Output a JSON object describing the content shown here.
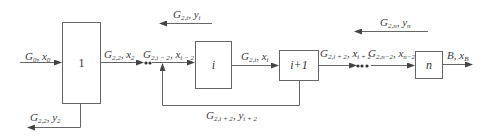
{
  "diagram": {
    "type": "block-flow",
    "line_color": "#555555",
    "blocks": [
      {
        "id": "1",
        "label": "1"
      },
      {
        "id": "i",
        "label": "i"
      },
      {
        "id": "i+1",
        "label": "i+1"
      },
      {
        "id": "n",
        "label": "n"
      }
    ],
    "streams": {
      "feed": {
        "main": "G",
        "sub": "0",
        "sep": ", ",
        "var": "x",
        "vsub": "0"
      },
      "x2": {
        "main": "G",
        "sub": "2,2",
        "sep": ", ",
        "var": "x",
        "vsub": "2"
      },
      "y2": {
        "main": "G",
        "sub": "2,2",
        "sep": ", ",
        "var": "y",
        "vsub": "2"
      },
      "xi_2": {
        "main": "G",
        "sub": "2,i − 2",
        "sep": ", ",
        "var": "x",
        "vsub": "i − 2"
      },
      "yi": {
        "main": "G",
        "sub": "2,i",
        "sep": ", ",
        "var": "y",
        "vsub": "i"
      },
      "xi": {
        "main": "G",
        "sub": "2,i",
        "sep": ", ",
        "var": "x",
        "vsub": "i"
      },
      "yi2": {
        "main": "G",
        "sub": "2,i + 2",
        "sep": ", ",
        "var": "y",
        "vsub": "i + 2"
      },
      "xi2": {
        "main": "G",
        "sub": "2,i + 2",
        "sep": ", ",
        "var": "x",
        "vsub": "i + 2"
      },
      "xn_2": {
        "main": "G",
        "sub": "2,n−2",
        "sep": ", ",
        "var": "x",
        "vsub": "n−2"
      },
      "yn": {
        "main": "G",
        "sub": "2,n",
        "sep": ", ",
        "var": "y",
        "vsub": "n"
      },
      "bottom": {
        "main": "B",
        "sub": "",
        "sep": ", ",
        "var": "x",
        "vsub": "B"
      }
    },
    "ellipsis": "•••"
  }
}
